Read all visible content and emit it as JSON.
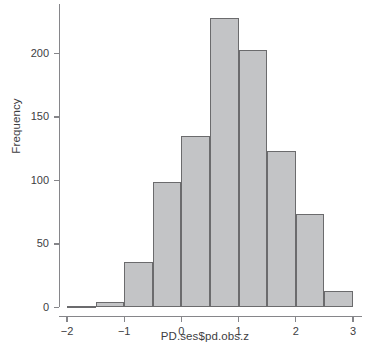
{
  "chart_data": {
    "type": "bar",
    "title": "",
    "xlabel": "PD.ses$pd.obs.z",
    "ylabel": "Frequency",
    "bin_width": 0.5,
    "bin_edges": [
      -2,
      -1.5,
      -1,
      -0.5,
      0,
      0.5,
      1,
      1.5,
      2,
      2.5,
      3
    ],
    "categories": [
      "-2 to -1.5",
      "-1.5 to -1",
      "-1 to -0.5",
      "-0.5 to 0",
      "0 to 0.5",
      "0.5 to 1",
      "1 to 1.5",
      "1.5 to 2",
      "2 to 2.5",
      "2.5 to 3"
    ],
    "values": [
      1,
      4,
      36,
      99,
      135,
      228,
      203,
      123,
      74,
      13
    ],
    "xlim": [
      -2,
      3
    ],
    "ylim": [
      0,
      232
    ],
    "xticks": [
      -2,
      -1,
      0,
      1,
      2,
      3
    ],
    "xtick_labels": [
      "−2",
      "−1",
      "0",
      "1",
      "2",
      "3"
    ],
    "yticks": [
      0,
      50,
      100,
      150,
      200
    ],
    "ytick_labels": [
      "0",
      "50",
      "100",
      "150",
      "200"
    ],
    "grid": false,
    "legend": false,
    "bar_fill_color": "#c3c4c6",
    "bar_edge_color": "#6b6b6d",
    "axis_color": "#86868a",
    "text_color": "#3d3d3f"
  }
}
